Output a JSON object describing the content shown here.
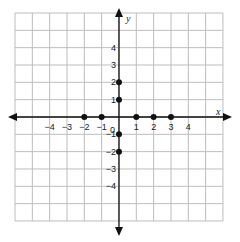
{
  "chart_data": {
    "type": "scatter",
    "title": "",
    "xlabel": "x",
    "ylabel": "y",
    "xlim": [
      -6,
      6
    ],
    "ylim": [
      -6,
      6
    ],
    "grid": true,
    "x_ticks": [
      -4,
      -3,
      -2,
      -1,
      1,
      2,
      3,
      4
    ],
    "y_ticks": [
      4,
      3,
      2,
      1,
      -1,
      -2,
      -3,
      -4
    ],
    "origin_label": "0",
    "series": [
      {
        "name": "points",
        "points": [
          {
            "x": -2,
            "y": 0
          },
          {
            "x": -1,
            "y": 0
          },
          {
            "x": 1,
            "y": 0
          },
          {
            "x": 2,
            "y": 0
          },
          {
            "x": 3,
            "y": 0
          },
          {
            "x": 0,
            "y": 2
          },
          {
            "x": 0,
            "y": 1
          },
          {
            "x": 0,
            "y": -1
          },
          {
            "x": 0,
            "y": -2
          }
        ]
      }
    ],
    "colors": {
      "grid": "#bdbdbd",
      "axis": "#111111",
      "point": "#111111"
    }
  }
}
